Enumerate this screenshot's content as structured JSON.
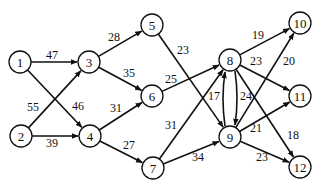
{
  "diagram": {
    "type": "directed-weighted-network",
    "nodes": [
      {
        "id": "1",
        "x": 20,
        "y": 62
      },
      {
        "id": "2",
        "x": 21,
        "y": 136
      },
      {
        "id": "3",
        "x": 89,
        "y": 62
      },
      {
        "id": "4",
        "x": 90,
        "y": 136
      },
      {
        "id": "5",
        "x": 152,
        "y": 25
      },
      {
        "id": "6",
        "x": 152,
        "y": 96
      },
      {
        "id": "7",
        "x": 153,
        "y": 168
      },
      {
        "id": "8",
        "x": 230,
        "y": 60
      },
      {
        "id": "9",
        "x": 230,
        "y": 137
      },
      {
        "id": "10",
        "x": 300,
        "y": 23
      },
      {
        "id": "11",
        "x": 300,
        "y": 96
      },
      {
        "id": "12",
        "x": 300,
        "y": 167
      }
    ],
    "edges": [
      {
        "from": "1",
        "to": "3",
        "weight": "47",
        "lx": 52,
        "ly": 55
      },
      {
        "from": "1",
        "to": "4",
        "weight": "46",
        "lx": 78,
        "ly": 106
      },
      {
        "from": "2",
        "to": "3",
        "weight": "55",
        "lx": 33,
        "ly": 107
      },
      {
        "from": "2",
        "to": "4",
        "weight": "39",
        "lx": 52,
        "ly": 143
      },
      {
        "from": "3",
        "to": "5",
        "weight": "28",
        "lx": 114,
        "ly": 37
      },
      {
        "from": "3",
        "to": "6",
        "weight": "35",
        "lx": 129,
        "ly": 73
      },
      {
        "from": "4",
        "to": "6",
        "weight": "31",
        "lx": 116,
        "ly": 108
      },
      {
        "from": "4",
        "to": "7",
        "weight": "27",
        "lx": 129,
        "ly": 145
      },
      {
        "from": "5",
        "to": "9",
        "weight": "23",
        "lx": 183,
        "ly": 50
      },
      {
        "from": "6",
        "to": "8",
        "weight": "25",
        "lx": 171,
        "ly": 79
      },
      {
        "from": "7",
        "to": "8",
        "weight": "31",
        "lx": 171,
        "ly": 125
      },
      {
        "from": "7",
        "to": "9",
        "weight": "34",
        "lx": 198,
        "ly": 157
      },
      {
        "from": "9",
        "to": "8",
        "weight": "17",
        "lx": 214,
        "ly": 96,
        "curve": "left"
      },
      {
        "from": "8",
        "to": "9",
        "weight": "24",
        "lx": 246,
        "ly": 96,
        "curve": "right"
      },
      {
        "from": "8",
        "to": "10",
        "weight": "19",
        "lx": 258,
        "ly": 35
      },
      {
        "from": "8",
        "to": "11",
        "weight": "23",
        "lx": 256,
        "ly": 61
      },
      {
        "from": "8",
        "to": "12",
        "weight": "18",
        "lx": 293,
        "ly": 135
      },
      {
        "from": "9",
        "to": "10",
        "weight": "20",
        "lx": 289,
        "ly": 61
      },
      {
        "from": "9",
        "to": "11",
        "weight": "21",
        "lx": 256,
        "ly": 128
      },
      {
        "from": "9",
        "to": "12",
        "weight": "23",
        "lx": 262,
        "ly": 157
      }
    ]
  }
}
